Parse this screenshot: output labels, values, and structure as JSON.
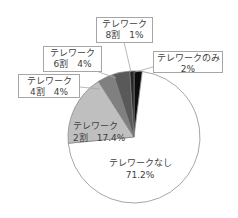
{
  "chart_data": {
    "type": "pie",
    "title": "",
    "start_angle_deg": 0,
    "direction": "clockwise",
    "slices": [
      {
        "key": "only",
        "label": "テレワークのみ",
        "line1": "テレワークのみ",
        "line2": "2%",
        "value": 2.0,
        "color": "#0d0d0d"
      },
      {
        "key": "none",
        "label": "テレワークなし",
        "line1": "テレワークなし",
        "line2": "71.2%",
        "value": 71.2,
        "color": "#ffffff"
      },
      {
        "key": "r2",
        "label": "テレワーク 2割",
        "line1": "テレワーク",
        "line2": "2割　17.4%",
        "value": 17.4,
        "color": "#bfbfbf"
      },
      {
        "key": "r4",
        "label": "テレワーク 4割",
        "line1": "テレワーク",
        "line2": "4割　4%",
        "value": 4.0,
        "color": "#808080"
      },
      {
        "key": "r6",
        "label": "テレワーク 6割",
        "line1": "テレワーク",
        "line2": "6割　4%",
        "value": 4.0,
        "color": "#595959"
      },
      {
        "key": "r8",
        "label": "テレワーク 8割",
        "line1": "テレワーク",
        "line2": "8割　1%",
        "value": 1.0,
        "color": "#262626"
      }
    ],
    "categories": [
      "テレワークのみ",
      "テレワークなし",
      "テレワーク 2割",
      "テレワーク 4割",
      "テレワーク 6割",
      "テレワーク 8割"
    ],
    "values": [
      2.0,
      71.2,
      17.4,
      4.0,
      4.0,
      1.0
    ],
    "unit": "%",
    "legend": "none (data labels with callouts)"
  },
  "style": {
    "slice_border": "#7f7f7f",
    "label_border": "#a6a6a6",
    "text_color": "#404040"
  }
}
